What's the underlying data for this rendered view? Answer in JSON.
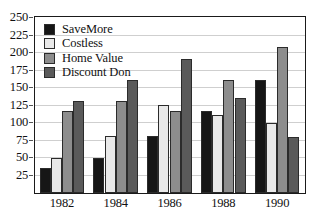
{
  "chart_data": {
    "type": "bar",
    "title": "",
    "subtitle": "",
    "xlabel": "",
    "ylabel": "",
    "categories": [
      "1982",
      "1984",
      "1986",
      "1988",
      "1990"
    ],
    "series": [
      {
        "name": "SaveMore",
        "color": "#161616",
        "values": [
          36,
          50,
          81,
          117,
          161
        ]
      },
      {
        "name": "Costless",
        "color": "#e9e9e9",
        "values": [
          50,
          81,
          126,
          111,
          100
        ]
      },
      {
        "name": "Home Value",
        "color": "#8d8d8d",
        "values": [
          117,
          132,
          117,
          161,
          209
        ]
      },
      {
        "name": "Discount Don",
        "color": "#5a5a5a",
        "values": [
          132,
          161,
          191,
          136,
          80
        ]
      }
    ],
    "ylim": [
      0,
      250
    ],
    "yticks": [
      25,
      50,
      75,
      100,
      125,
      150,
      175,
      200,
      225,
      250
    ],
    "ytick_labels": [
      "25",
      "50",
      "75",
      "100",
      "125",
      "150",
      "175",
      "200",
      "225",
      "250"
    ],
    "grid": true,
    "grid_axis": "y",
    "legend_position": "top-left",
    "legend_entries": [
      "SaveMore",
      "Costless",
      "Home Value",
      "Discount Don"
    ],
    "annotations": []
  }
}
